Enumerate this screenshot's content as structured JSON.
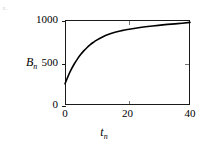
{
  "figure": {
    "marker": "r.",
    "background": "#ffffff",
    "ink": "#000000"
  },
  "chart_data": {
    "type": "line",
    "title": "",
    "subtitle": "",
    "xlabel": "t_n",
    "ylabel": "B_n",
    "xlabel_base": "t",
    "xlabel_sub": "n",
    "ylabel_base": "B",
    "ylabel_sub": "n",
    "xlim": [
      0,
      40
    ],
    "ylim": [
      0,
      1000
    ],
    "xticks": [
      0,
      20,
      40
    ],
    "xtick_labels": [
      "0",
      "20",
      "40"
    ],
    "yticks": [
      0,
      500,
      1000
    ],
    "ytick_labels": [
      "0",
      "500",
      "1000"
    ],
    "grid": false,
    "legend": null,
    "legend_position": "none",
    "frame": "box",
    "ticks_mirrored": true,
    "series": [
      {
        "name": "B_n",
        "color": "#000000",
        "linewidth": 1.6,
        "x": [
          0,
          1,
          2,
          3,
          4,
          5,
          6,
          7,
          8,
          9,
          10,
          12,
          14,
          16,
          18,
          20,
          24,
          28,
          32,
          36,
          40
        ],
        "y": [
          250,
          340,
          418,
          485,
          543,
          593,
          637,
          674,
          707,
          735,
          760,
          800,
          831,
          855,
          874,
          889,
          912,
          930,
          945,
          957,
          972
        ]
      }
    ],
    "annotations": []
  }
}
